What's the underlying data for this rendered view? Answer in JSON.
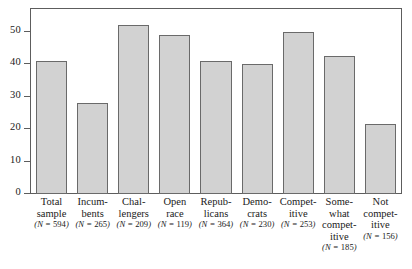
{
  "chart_data": {
    "type": "bar",
    "title": "",
    "subtitle": "",
    "xlabel": "",
    "ylabel": "",
    "ylim": [
      0,
      57
    ],
    "yticks": [
      0,
      10,
      20,
      30,
      40,
      50
    ],
    "ytick_labels": [
      "0",
      "10",
      "20",
      "30",
      "40",
      "50"
    ],
    "grid": false,
    "legend": null,
    "bar_color": "#d2d2d2",
    "bar_border_color": "#6a6a6a",
    "axis_color": "#5d5d5d",
    "categories": [
      "Total\nsample",
      "Incum-\nbents",
      "Chal-\nlengers",
      "Open\nrace",
      "Repub-\nlicans",
      "Demo-\ncrats",
      "Compet-\nitive",
      "Some-\nwhat\ncompet-\nitive",
      "Not\ncompet-\nitive"
    ],
    "values": [
      41,
      28,
      52,
      49,
      41,
      40,
      50,
      42.5,
      21.5
    ],
    "sample_sizes": [
      594,
      265,
      209,
      119,
      364,
      230,
      253,
      185,
      156
    ],
    "sample_size_labels": [
      "(N = 594)",
      "(N = 265)",
      "(N = 209)",
      "(N = 119)",
      "(N = 364)",
      "(N = 230)",
      "(N = 253)",
      "(N = 185)",
      "(N = 156)"
    ],
    "n_label_rows": [
      2,
      2,
      2,
      2,
      2,
      2,
      2,
      4,
      3
    ]
  }
}
